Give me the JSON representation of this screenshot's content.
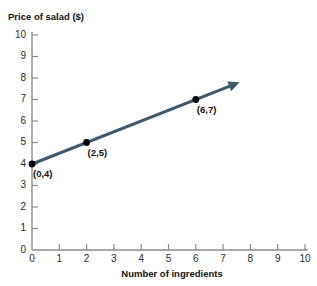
{
  "chart_data": {
    "type": "line",
    "title": "Price of salad ($)",
    "xlabel": "Number of ingredients",
    "ylabel": "Price of salad ($)",
    "xlim": [
      0,
      10
    ],
    "ylim": [
      0,
      10
    ],
    "grid": false,
    "legend": "none",
    "x_ticks": [
      "0",
      "1",
      "2",
      "3",
      "4",
      "5",
      "6",
      "7",
      "8",
      "9",
      "10"
    ],
    "y_ticks": [
      "0",
      "1",
      "2",
      "3",
      "4",
      "5",
      "6",
      "7",
      "8",
      "9",
      "10"
    ],
    "line_color": "#3d5a6c",
    "point_color": "#000000",
    "axis_color": "#8c8c8c",
    "series": [
      {
        "name": "Price of salad",
        "slope": 0.5,
        "intercept": 4,
        "x_start": 0,
        "x_end": 7.6,
        "arrow_at_end": true,
        "values": [
          {
            "x": 0,
            "y": 4
          },
          {
            "x": 7.6,
            "y": 7.8
          }
        ]
      }
    ],
    "points": [
      {
        "x": 0,
        "y": 4,
        "label": "(0,4)"
      },
      {
        "x": 2,
        "y": 5,
        "label": "(2,5)"
      },
      {
        "x": 6,
        "y": 7,
        "label": "(6,7)"
      }
    ]
  }
}
